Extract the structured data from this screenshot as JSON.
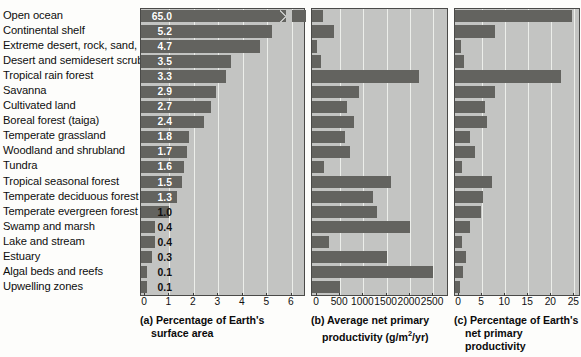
{
  "figure": {
    "title": "",
    "biomes": [
      "Open ocean",
      "Continental shelf",
      "Extreme desert, rock, sand, ice",
      "Desert and semidesert scrub",
      "Tropical rain forest",
      "Savanna",
      "Cultivated land",
      "Boreal forest (taiga)",
      "Temperate grassland",
      "Woodland and shrubland",
      "Tundra",
      "Tropical seasonal forest",
      "Temperate deciduous forest",
      "Temperate evergreen forest",
      "Swamp and marsh",
      "Lake and stream",
      "Estuary",
      "Algal beds and reefs",
      "Upwelling zones"
    ],
    "colors": {
      "bar": "#63635f",
      "panel_background": "#c3c4c2",
      "gridline": "#eceeea",
      "panel_border": "#4a4a48",
      "value_label": "#ffffff",
      "text": "#0d0d0d"
    }
  },
  "panel_a": {
    "caption_line1": "(a) Percentage of Earth's",
    "caption_line2": "surface area",
    "ticks": [
      "0",
      "1",
      "2",
      "3",
      "4",
      "5",
      "6"
    ],
    "value_labels": [
      "65.0",
      "5.2",
      "4.7",
      "3.5",
      "3.3",
      "2.9",
      "2.7",
      "2.4",
      "1.8",
      "1.7",
      "1.6",
      "1.5",
      "1.3",
      "1.0",
      "0.4",
      "0.4",
      "0.3",
      "0.1",
      "0.1"
    ]
  },
  "panel_b": {
    "caption_line1": "(b) Average net primary",
    "caption_line2_pre": "productivity (g/m",
    "caption_line2_sup": "2",
    "caption_line2_post": "/yr)",
    "ticks": [
      "0",
      "500",
      "1000",
      "1500",
      "2000",
      "2500"
    ]
  },
  "panel_c": {
    "caption_line1": "(c) Percentage of Earth's",
    "caption_line2": "net primary productivity",
    "ticks": [
      "0",
      "5",
      "10",
      "15",
      "20",
      "25"
    ]
  },
  "chart_data": {
    "type": "bar",
    "orientation": "horizontal",
    "categories": [
      "Open ocean",
      "Continental shelf",
      "Extreme desert, rock, sand, ice",
      "Desert and semidesert scrub",
      "Tropical rain forest",
      "Savanna",
      "Cultivated land",
      "Boreal forest (taiga)",
      "Temperate grassland",
      "Woodland and shrubland",
      "Tundra",
      "Tropical seasonal forest",
      "Temperate deciduous forest",
      "Temperate evergreen forest",
      "Swamp and marsh",
      "Lake and stream",
      "Estuary",
      "Algal beds and reefs",
      "Upwelling zones"
    ],
    "panels": [
      {
        "key": "a",
        "label": "(a) Percentage of Earth's surface area",
        "xlabel": "Percentage of Earth's surface area",
        "xlim": [
          0,
          6.5
        ],
        "xticks": [
          0,
          1,
          2,
          3,
          4,
          5,
          6
        ],
        "axis_break": true,
        "axis_break_row": "Open ocean",
        "grid": true,
        "values": [
          65.0,
          5.2,
          4.7,
          3.5,
          3.3,
          2.9,
          2.7,
          2.4,
          1.8,
          1.7,
          1.6,
          1.5,
          1.3,
          1.0,
          0.4,
          0.4,
          0.3,
          0.1,
          0.1
        ],
        "data_labels": [
          "65.0",
          "5.2",
          "4.7",
          "3.5",
          "3.3",
          "2.9",
          "2.7",
          "2.4",
          "1.8",
          "1.7",
          "1.6",
          "1.5",
          "1.3",
          "1.0",
          "0.4",
          "0.4",
          "0.3",
          "0.1",
          "0.1"
        ]
      },
      {
        "key": "b",
        "label": "(b) Average net primary productivity (g/m2/yr)",
        "xlabel": "Average net primary productivity (g/m²/yr)",
        "xlim": [
          0,
          2800
        ],
        "xticks": [
          0,
          500,
          1000,
          1500,
          2000,
          2500
        ],
        "grid": true,
        "values": [
          125,
          360,
          3,
          90,
          2200,
          900,
          650,
          800,
          600,
          700,
          140,
          1600,
          1200,
          1300,
          2000,
          250,
          1500,
          2500,
          500
        ]
      },
      {
        "key": "c",
        "label": "(c) Percentage of Earth's net primary productivity",
        "xlabel": "Percentage of Earth's net primary productivity",
        "xlim": [
          0,
          26
        ],
        "xticks": [
          0,
          5,
          10,
          15,
          20,
          25
        ],
        "grid": true,
        "values": [
          24.4,
          7.9,
          0.5,
          1.1,
          22.0,
          7.9,
          5.6,
          6.0,
          2.4,
          3.4,
          0.6,
          7.1,
          5.2,
          4.7,
          2.3,
          0.6,
          1.5,
          0.9,
          0.2
        ]
      }
    ]
  }
}
